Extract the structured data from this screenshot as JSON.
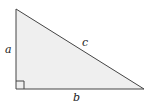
{
  "diagram": {
    "type": "right-triangle",
    "fill_color": "#efefef",
    "stroke_color": "#444444",
    "labels": {
      "vertical_leg": "a",
      "horizontal_leg": "b",
      "hypotenuse": "c"
    },
    "right_angle_marker": true
  }
}
